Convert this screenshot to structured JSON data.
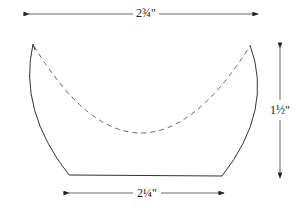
{
  "diagram": {
    "dimensions": {
      "top_width": "2¾\"",
      "bottom_width": "2¼\"",
      "height": "1½\""
    },
    "colors": {
      "stroke": "#333333",
      "dashed": "#555555",
      "background": "#ffffff"
    }
  }
}
